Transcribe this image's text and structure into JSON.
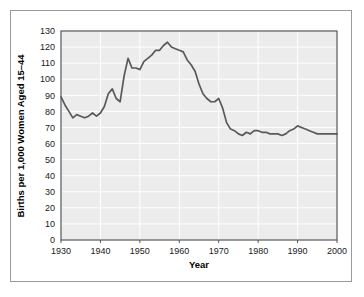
{
  "chart_data": {
    "type": "line",
    "title": "",
    "xlabel": "Year",
    "ylabel": "Births per 1,000 Women Aged 15–44",
    "xlim": [
      1930,
      2000
    ],
    "ylim": [
      0,
      130
    ],
    "xticks": [
      1930,
      1940,
      1950,
      1960,
      1970,
      1980,
      1990,
      2000
    ],
    "yticks": [
      0,
      10,
      20,
      30,
      40,
      50,
      60,
      70,
      80,
      90,
      100,
      110,
      120,
      130
    ],
    "grid": true,
    "legend": null,
    "series": [
      {
        "name": "Birth rate",
        "color": "#595959",
        "x": [
          1930,
          1931,
          1932,
          1933,
          1934,
          1935,
          1936,
          1937,
          1938,
          1939,
          1940,
          1941,
          1942,
          1943,
          1944,
          1945,
          1946,
          1947,
          1948,
          1949,
          1950,
          1951,
          1952,
          1953,
          1954,
          1955,
          1956,
          1957,
          1958,
          1959,
          1960,
          1961,
          1962,
          1963,
          1964,
          1965,
          1966,
          1967,
          1968,
          1969,
          1970,
          1971,
          1972,
          1973,
          1974,
          1975,
          1976,
          1977,
          1978,
          1979,
          1980,
          1981,
          1982,
          1983,
          1984,
          1985,
          1986,
          1987,
          1988,
          1989,
          1990,
          1991,
          1992,
          1993,
          1994,
          1995,
          1996,
          1997,
          1998,
          1999,
          2000
        ],
        "values": [
          89,
          84,
          80,
          76,
          78,
          77,
          76,
          77,
          79,
          77,
          79,
          83,
          91,
          94,
          88,
          86,
          102,
          113,
          107,
          107,
          106,
          111,
          113,
          115,
          118,
          118,
          121,
          123,
          120,
          119,
          118,
          117,
          112,
          109,
          105,
          97,
          91,
          88,
          86,
          86,
          88,
          82,
          73,
          69,
          68,
          66,
          65,
          67,
          66,
          68,
          68,
          67,
          67,
          66,
          66,
          66,
          65,
          66,
          68,
          69,
          71,
          70,
          69,
          68,
          67,
          66,
          66,
          66,
          66,
          66,
          66
        ]
      }
    ]
  },
  "axes": {
    "x_tick_labels": [
      "1930",
      "1940",
      "1950",
      "1960",
      "1970",
      "1980",
      "1990",
      "2000"
    ],
    "y_tick_labels": [
      "0",
      "10",
      "20",
      "30",
      "40",
      "50",
      "60",
      "70",
      "80",
      "90",
      "100",
      "110",
      "120",
      "130"
    ],
    "x_axis_title": "Year",
    "y_axis_title": "Births per 1,000 Women Aged 15–44"
  },
  "style": {
    "plot_background": "#ececec",
    "gridline_color": "#ffffff",
    "line_color": "#595959",
    "axis_color": "#555555",
    "frame_color": "#9a9a9a",
    "text_color": "#1a1a1a",
    "page_background": "#ffffff"
  }
}
